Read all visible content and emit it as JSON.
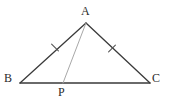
{
  "figure": {
    "type": "geometry-diagram",
    "width": 169,
    "height": 101,
    "background_color": "#ffffff",
    "stroke_color": "#3a3a3a",
    "cevian_color": "#a8a8a8",
    "tick_color": "#555555",
    "label_color": "#2b2b2b",
    "points": {
      "A": {
        "label": "A",
        "x": 86,
        "y": 23
      },
      "B": {
        "label": "B",
        "x": 20,
        "y": 83
      },
      "C": {
        "label": "C",
        "x": 150,
        "y": 83
      },
      "P": {
        "label": "P",
        "x": 63,
        "y": 83
      }
    },
    "segments": [
      {
        "name": "AB",
        "from": "A",
        "to": "B",
        "style": "solid",
        "color": "#3a3a3a",
        "width": 1.3
      },
      {
        "name": "AC",
        "from": "A",
        "to": "C",
        "style": "solid",
        "color": "#3a3a3a",
        "width": 1.3
      },
      {
        "name": "BC",
        "from": "B",
        "to": "C",
        "style": "solid",
        "color": "#3a3a3a",
        "width": 1.3
      },
      {
        "name": "AP",
        "from": "A",
        "to": "P",
        "style": "solid",
        "color": "#a8a8a8",
        "width": 1.0
      }
    ],
    "tick_marks": [
      {
        "name": "tick-AB",
        "on_segment": "AB",
        "count": 1,
        "x": 55,
        "y": 47.5
      },
      {
        "name": "tick-AC",
        "on_segment": "AC",
        "count": 1,
        "x": 112,
        "y": 48.5
      }
    ]
  }
}
